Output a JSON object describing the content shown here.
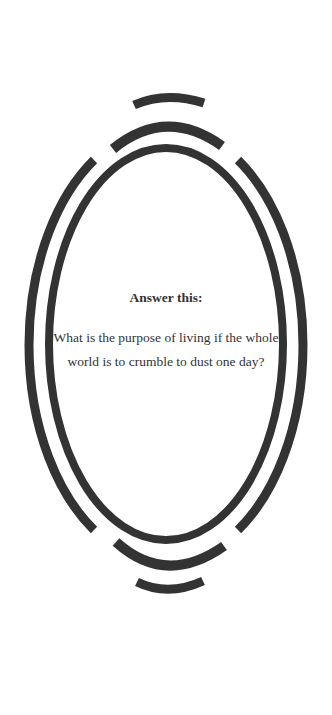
{
  "heading": "Answer this:",
  "question": "What is the purpose of living if the whole world is to crumble to dust one day?",
  "colors": {
    "background": "#ffffff",
    "stroke": "#333333",
    "text": "#333333"
  }
}
